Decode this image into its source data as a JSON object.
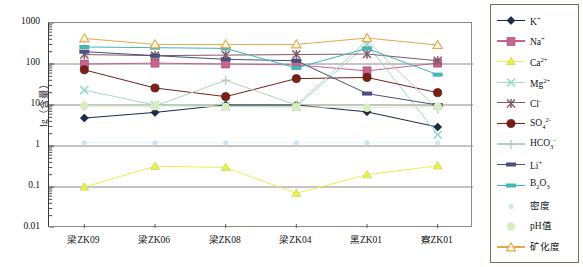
{
  "chart_data": {
    "type": "line",
    "title": "",
    "xlabel": "",
    "ylabel": "lg（含量）",
    "ylim": [
      0.01,
      1000
    ],
    "yscale": "log",
    "grid": true,
    "legend_position": "right",
    "ytick_labels": [
      "1000",
      "100",
      "10",
      "1",
      "0.1",
      "0.01"
    ],
    "ytick_values": [
      1000,
      100,
      10,
      1,
      0.1,
      0.01
    ],
    "categories": [
      "梁ZK09",
      "梁ZK06",
      "梁ZK08",
      "梁ZK04",
      "黑ZK01",
      "察ZK01"
    ],
    "series": [
      {
        "name": "K+",
        "label_html": "K<sup>+</sup>",
        "color": "#1b2a4a",
        "marker": "diamond",
        "filled": true,
        "values": [
          4.8,
          6.6,
          10.0,
          10.0,
          6.8,
          2.9
        ]
      },
      {
        "name": "Na+",
        "label_html": "Na<sup>+</sup>",
        "color": "#c9638f",
        "marker": "square",
        "filled": true,
        "values": [
          100,
          105,
          100,
          95,
          68,
          105
        ]
      },
      {
        "name": "Ca2+",
        "label_html": "Ca<sup>2+</sup>",
        "color": "#e8ef52",
        "marker": "triangle",
        "filled": true,
        "values": [
          0.1,
          0.32,
          0.3,
          0.07,
          0.2,
          0.33
        ]
      },
      {
        "name": "Mg2+",
        "label_html": "Mg<sup>2+</sup>",
        "color": "#9fd9c8",
        "marker": "x",
        "filled": false,
        "values": [
          23,
          10.0,
          9.2,
          9.0,
          300,
          1.9
        ]
      },
      {
        "name": "Cl-",
        "label_html": "Cl<sup>-</sup>",
        "color": "#7d5a66",
        "marker": "asterisk",
        "filled": true,
        "values": [
          170,
          160,
          165,
          170,
          175,
          120
        ]
      },
      {
        "name": "SO42-",
        "label_html": "SO<sub>4</sub><sup>2-</sup>",
        "color": "#7a2016",
        "marker": "circle",
        "filled": true,
        "values": [
          72,
          26,
          16,
          44,
          47,
          20
        ]
      },
      {
        "name": "HCO3-",
        "label_html": "HCO<sub>3</sub><sup>-</sup>",
        "color": "#b8cfc0",
        "marker": "plus",
        "filled": false,
        "values": [
          9.5,
          9.5,
          40,
          10.0,
          370,
          8.0
        ]
      },
      {
        "name": "Li+",
        "label_html": "Li<sup>+</sup>",
        "color": "#4a4f80",
        "marker": "dash",
        "filled": true,
        "values": [
          200,
          160,
          130,
          120,
          19,
          10.0
        ]
      },
      {
        "name": "B2O3",
        "label_html": "B<sub>2</sub>O<sub>3</sub>",
        "color": "#44b5b8",
        "marker": "dash",
        "filled": true,
        "values": [
          260,
          250,
          240,
          80,
          240,
          55
        ]
      },
      {
        "name": "密度",
        "label_html": "密度",
        "color": "#cfe4ee",
        "marker": "dot",
        "filled": true,
        "values": [
          1.2,
          1.2,
          1.2,
          1.2,
          1.2,
          1.2
        ]
      },
      {
        "name": "pH值",
        "label_html": "pH值",
        "color": "#d8ecc0",
        "marker": "dot-lg",
        "filled": true,
        "values": [
          9.5,
          9.5,
          9.0,
          9.0,
          8.6,
          9.2
        ]
      },
      {
        "name": "矿化度",
        "label_html": "矿化度",
        "color": "#e0a94a",
        "marker": "triangle-open",
        "filled": false,
        "values": [
          420,
          300,
          300,
          300,
          430,
          290
        ]
      }
    ]
  },
  "legend": {
    "items": [
      {
        "label": "K+"
      },
      {
        "label": "Na+"
      },
      {
        "label": "Ca2+"
      },
      {
        "label": "Mg2+"
      },
      {
        "label": "Cl-"
      },
      {
        "label": "SO42-"
      },
      {
        "label": "HCO3-"
      },
      {
        "label": "Li+"
      },
      {
        "label": "B2O3"
      },
      {
        "label": "密度"
      },
      {
        "label": "pH值"
      },
      {
        "label": "矿化度"
      }
    ]
  }
}
